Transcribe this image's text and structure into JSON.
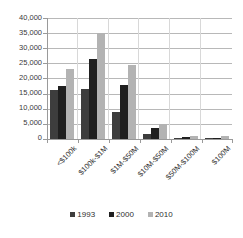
{
  "chart_data": {
    "type": "bar",
    "title": "",
    "subtitle": "",
    "xlabel": "",
    "ylabel": "",
    "ylim": [
      0,
      40000
    ],
    "grid": true,
    "legend_position": "bottom",
    "categories": [
      "<$100k",
      "$100k-$1M",
      "$1M-$50M",
      "$10M-$50M",
      "$50M-$100M",
      "$100M"
    ],
    "ytick_labels": [
      "0",
      "5,000",
      "10,000",
      "15,000",
      "20,000",
      "25,000",
      "30,000",
      "35,000",
      "40,000"
    ],
    "ytick_values": [
      0,
      5000,
      10000,
      15000,
      20000,
      25000,
      30000,
      35000,
      40000
    ],
    "series": [
      {
        "name": "1993",
        "color": "#3d3d3d",
        "values": [
          16100,
          16400,
          8900,
          1700,
          300,
          250
        ]
      },
      {
        "name": "2000",
        "color": "#1f1f1f",
        "values": [
          17600,
          26300,
          17700,
          3700,
          550,
          450
        ]
      },
      {
        "name": "2010",
        "color": "#b3b3b3",
        "values": [
          23000,
          35000,
          24400,
          4900,
          900,
          850
        ]
      }
    ]
  },
  "legend": {
    "items": [
      {
        "label": "1993"
      },
      {
        "label": "2000"
      },
      {
        "label": "2010"
      }
    ]
  }
}
